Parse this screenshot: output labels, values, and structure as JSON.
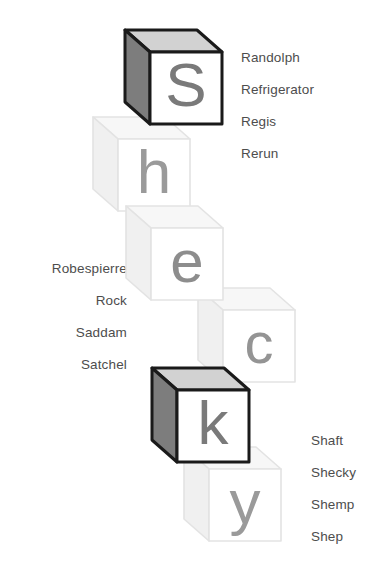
{
  "canvas": {
    "width": 386,
    "height": 570,
    "background": "#ffffff"
  },
  "word": "Shecky",
  "palette": {
    "dark_outline": "#1a1a1a",
    "dark_side": "#7d7d7d",
    "dark_top": "#d2d2d2",
    "dark_front": "#ffffff",
    "dark_letter": "#7a7a7a",
    "faded_outline": "#e3e3e3",
    "faded_side": "#f0f0f0",
    "faded_top": "#f7f7f7",
    "faded_front": "#ffffff",
    "faded_letter": "#c9c9c9",
    "mid_letter": "#8d8d8d",
    "text_color": "#4d4d4d"
  },
  "blocks": [
    {
      "letter": "S",
      "state": "active",
      "x": 125,
      "y": 30,
      "z": 60,
      "letter_color": "#7a7a7a",
      "letter_size": 62
    },
    {
      "letter": "h",
      "state": "faded",
      "x": 93,
      "y": 117,
      "z": 20,
      "letter_color": "#9a9a9a",
      "letter_size": 62
    },
    {
      "letter": "e",
      "state": "faded",
      "x": 126,
      "y": 206,
      "z": 30,
      "letter_color": "#8d8d8d",
      "letter_size": 60
    },
    {
      "letter": "c",
      "state": "faded",
      "x": 198,
      "y": 288,
      "z": 10,
      "letter_color": "#949494",
      "letter_size": 58
    },
    {
      "letter": "k",
      "state": "active",
      "x": 152,
      "y": 368,
      "z": 70,
      "letter_color": "#7a7a7a",
      "letter_size": 62
    },
    {
      "letter": "y",
      "state": "faded",
      "x": 184,
      "y": 447,
      "z": 15,
      "letter_color": "#9a9a9a",
      "letter_size": 62
    }
  ],
  "lists": {
    "top_right": {
      "name": "r-names",
      "items": [
        "Randolph",
        "Refrigerator",
        "Regis",
        "Rerun"
      ]
    },
    "left": {
      "name": "ro-sa-names",
      "items": [
        "Robespierre",
        "Rock",
        "Saddam",
        "Satchel"
      ]
    },
    "bottom_right": {
      "name": "sh-names",
      "items": [
        "Shaft",
        "Shecky",
        "Shemp",
        "Shep"
      ]
    }
  }
}
